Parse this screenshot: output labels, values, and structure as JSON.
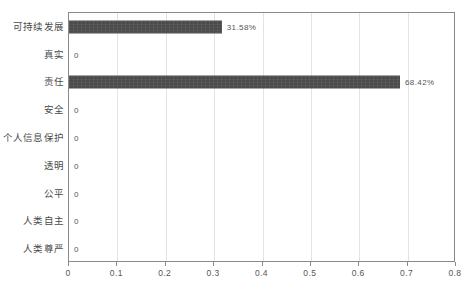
{
  "chart_data": {
    "type": "bar",
    "orientation": "horizontal",
    "title": "",
    "xlabel": "",
    "ylabel": "",
    "xlim": [
      0,
      0.8
    ],
    "grid": true,
    "legend": "none",
    "bar_color": "#4b4b4b",
    "categories": [
      "可持续发展",
      "真实",
      "责任",
      "安全",
      "个人信息保护",
      "透明",
      "公平",
      "人类自主",
      "人类尊严"
    ],
    "values": [
      0.3158,
      0,
      0.6842,
      0,
      0,
      0,
      0,
      0,
      0
    ],
    "data_labels": [
      "31.58%",
      "0",
      "68.42%",
      "0",
      "0",
      "0",
      "0",
      "0",
      "0"
    ],
    "xticks": [
      0,
      0.1,
      0.2,
      0.3,
      0.4,
      0.5,
      0.6,
      0.7,
      0.8
    ],
    "xtick_labels": [
      "0",
      "0.1",
      "0.2",
      "0.3",
      "0.4",
      "0.5",
      "0.6",
      "0.7",
      "0.8"
    ]
  }
}
